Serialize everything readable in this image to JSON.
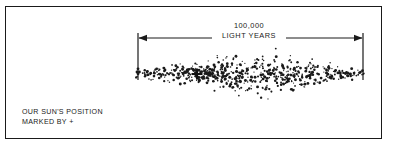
{
  "figure": {
    "title_caption": "Milky Way galaxy edge-on diagram",
    "frame_color": "#1a1a1a",
    "background_color": "#ffffff",
    "star_color": "#1a1a1a"
  },
  "dimension": {
    "value_line_1": "100,000",
    "value_line_2": "LIGHT YEARS",
    "arrow_left_x": 138,
    "arrow_right_x": 363,
    "arrow_y": 38,
    "tick_top_y": 33,
    "tick_bottom_y": 80
  },
  "caption": {
    "line_1": "OUR SUN'S POSITION",
    "line_2": "MARKED BY +"
  },
  "marker": {
    "symbol": "+",
    "label": "sun-position-marker",
    "x": 197,
    "y": 74
  },
  "chart_data": {
    "type": "scatter",
    "title": "100,000 LIGHT YEARS",
    "xlabel": "",
    "ylabel": "",
    "annotations": [
      "100,000",
      "LIGHT YEARS",
      "OUR SUN'S POSITION",
      "MARKED BY +"
    ],
    "galaxy_profile": {
      "description": "Edge-on lenticular disc of stippled dots, thin at the ends and bulging at the centre",
      "left_tip_x": 136,
      "right_tip_x": 364,
      "centerline_y": 74,
      "half_thickness_at_center": 31,
      "half_thickness_at_tips": 5,
      "dot_count": 620,
      "dot_radius_range": [
        0.55,
        1.5
      ]
    },
    "scale_bar": {
      "label": "100,000 LIGHT YEARS",
      "from_x": 138,
      "to_x": 363
    }
  }
}
